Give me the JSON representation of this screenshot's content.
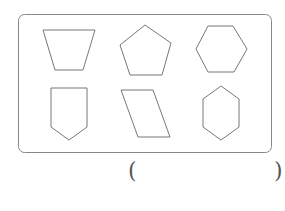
{
  "figure": {
    "stroke_color": "#777777",
    "frame": {
      "x": 18.5,
      "y": 14.5,
      "width": 253,
      "height": 138,
      "radius": 6
    },
    "shapes": [
      {
        "name": "trapezoid",
        "points": "43,30 95,30 83,70 55,70"
      },
      {
        "name": "regular-pentagon",
        "points": "145,25 171,43 162,75 130,75 120,45"
      },
      {
        "name": "regular-hexagon",
        "points": "196,49 208,26 233,26 247,49 234,72 208,72"
      },
      {
        "name": "shield-pentagon",
        "points": "51,88 87,88 87,127 69,140 51,127"
      },
      {
        "name": "parallelogram",
        "points": "121,90 153,90 170,137 138,137"
      },
      {
        "name": "vertical-hexagon",
        "points": "221,86 239,99 239,127 221,140 203,127 203,99"
      }
    ]
  },
  "answer": {
    "open_paren": "(",
    "close_paren": ")",
    "value": ""
  }
}
